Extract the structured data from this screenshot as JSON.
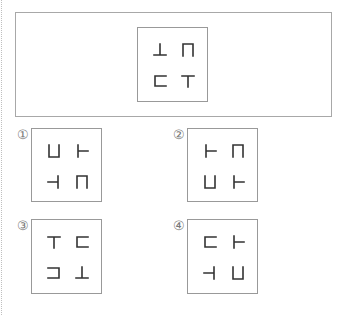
{
  "question": {
    "prompt_fragment": "",
    "reference": {
      "cells": [
        {
          "position": "top-left",
          "shape": "inverted-T",
          "glyph": "┴"
        },
        {
          "position": "top-right",
          "shape": "arch-open-bottom",
          "glyph": "⊓"
        },
        {
          "position": "bottom-left",
          "shape": "bracket-open-right",
          "glyph": "⊏"
        },
        {
          "position": "bottom-right",
          "shape": "T",
          "glyph": "┬"
        }
      ]
    }
  },
  "options": [
    {
      "label": "①",
      "cells": [
        {
          "position": "top-left",
          "shape": "cup-open-top",
          "glyph": "⊔"
        },
        {
          "position": "top-right",
          "shape": "T-pointing-right",
          "glyph": "├"
        },
        {
          "position": "bottom-left",
          "shape": "T-pointing-left",
          "glyph": "┤"
        },
        {
          "position": "bottom-right",
          "shape": "arch-open-bottom",
          "glyph": "⊓"
        }
      ]
    },
    {
      "label": "②",
      "cells": [
        {
          "position": "top-left",
          "shape": "T-pointing-right",
          "glyph": "├"
        },
        {
          "position": "top-right",
          "shape": "arch-open-bottom",
          "glyph": "⊓"
        },
        {
          "position": "bottom-left",
          "shape": "cup-open-top",
          "glyph": "⊔"
        },
        {
          "position": "bottom-right",
          "shape": "T-pointing-right",
          "glyph": "├"
        }
      ]
    },
    {
      "label": "③",
      "cells": [
        {
          "position": "top-left",
          "shape": "T",
          "glyph": "┬"
        },
        {
          "position": "top-right",
          "shape": "bracket-open-right",
          "glyph": "⊏"
        },
        {
          "position": "bottom-left",
          "shape": "bracket-open-left",
          "glyph": "⊐"
        },
        {
          "position": "bottom-right",
          "shape": "inverted-T",
          "glyph": "┴"
        }
      ]
    },
    {
      "label": "④",
      "cells": [
        {
          "position": "top-left",
          "shape": "bracket-open-right",
          "glyph": "⊏"
        },
        {
          "position": "top-right",
          "shape": "T-pointing-right",
          "glyph": "├"
        },
        {
          "position": "bottom-left",
          "shape": "T-pointing-left",
          "glyph": "┤"
        },
        {
          "position": "bottom-right",
          "shape": "cup-open-top",
          "glyph": "⊔"
        }
      ]
    }
  ],
  "colors": {
    "stroke": "#333333",
    "border": "#999999",
    "label": "#777777"
  }
}
